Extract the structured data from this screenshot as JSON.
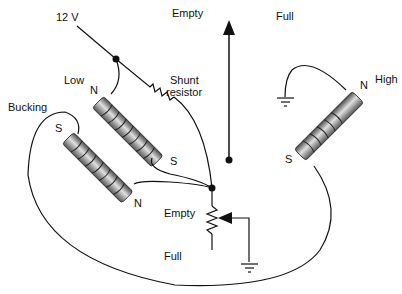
{
  "labels": {
    "supply": "12 V",
    "gauge_empty": "Empty",
    "gauge_full": "Full",
    "low_coil": "Low",
    "shunt_line1": "Shunt",
    "shunt_line2": "resistor",
    "bucking_coil": "Bucking",
    "high_coil": "High",
    "low_n": "N",
    "low_s": "S",
    "bucking_s": "S",
    "bucking_n": "N",
    "high_n": "N",
    "high_s": "S",
    "sender_empty": "Empty",
    "sender_full": "Full"
  },
  "colors": {
    "line": "#111111",
    "coil_dark": "#5a5a5a",
    "coil_light": "#d8d8d8"
  }
}
